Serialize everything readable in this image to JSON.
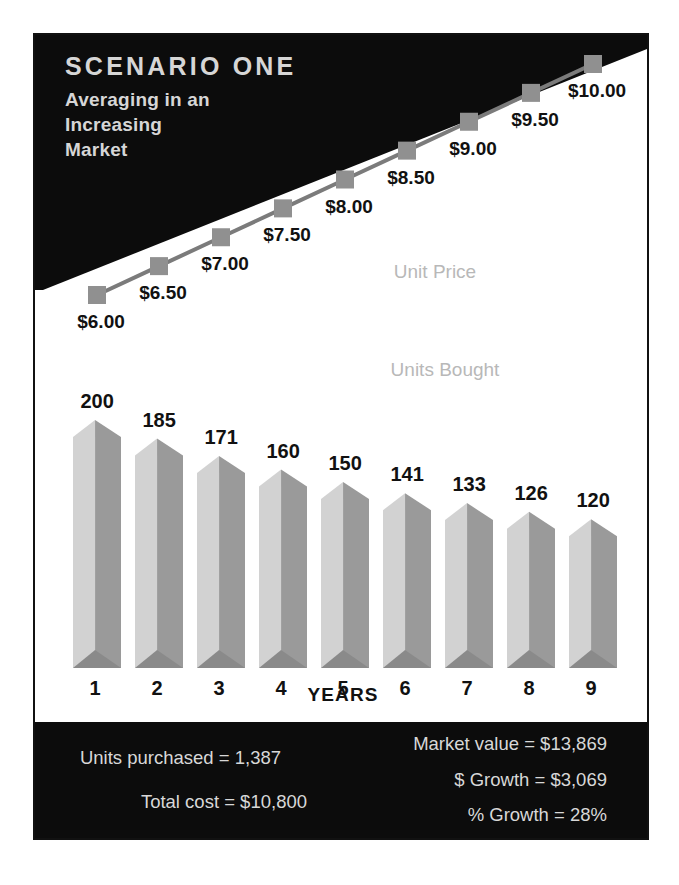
{
  "header": {
    "title": "SCENARIO ONE",
    "subtitle_lines": [
      "Averaging in an",
      "Increasing",
      "Market"
    ]
  },
  "captions": {
    "unit_price": "Unit Price",
    "units_bought": "Units Bought"
  },
  "axis": {
    "x_title": "YEARS"
  },
  "footer": {
    "left": [
      "Units purchased = 1,387",
      "Total cost = $10,800"
    ],
    "right": [
      "Market value = $13,869",
      "$ Growth = $3,069",
      "% Growth = 28%"
    ]
  },
  "colors": {
    "banner": "#0c0c0c",
    "bar_light": "#d2d2d2",
    "bar_dark": "#9a9a9a",
    "bar_foot": "#8a8a8a",
    "marker": "#909090",
    "line": "#7b7b7b",
    "caption": "#b8b8b8",
    "text": "#111111",
    "footer_text": "#d8d8d8"
  },
  "chart_data": {
    "type": "bar",
    "xlabel": "YEARS",
    "ylabel": "",
    "categories": [
      "1",
      "2",
      "3",
      "4",
      "5",
      "6",
      "7",
      "8",
      "9"
    ],
    "grid": false,
    "legend": "inline-captions",
    "series": [
      {
        "name": "Units Bought",
        "type": "bar",
        "values": [
          200,
          185,
          171,
          160,
          150,
          141,
          133,
          126,
          120
        ],
        "labels": [
          "200",
          "185",
          "171",
          "160",
          "150",
          "141",
          "133",
          "126",
          "120"
        ],
        "ylim": [
          0,
          200
        ]
      },
      {
        "name": "Unit Price",
        "type": "line",
        "values": [
          6.0,
          6.5,
          7.0,
          7.5,
          8.0,
          8.5,
          9.0,
          9.5,
          10.0
        ],
        "labels": [
          "$6.00",
          "$6.50",
          "$7.00",
          "$7.50",
          "$8.00",
          "$8.50",
          "$9.00",
          "$9.50",
          "$10.00"
        ],
        "ylim": [
          6.0,
          10.0
        ]
      }
    ],
    "annotations": [
      "Units purchased = 1,387",
      "Total cost = $10,800",
      "Market value = $13,869",
      "$ Growth = $3,069",
      "% Growth = 28%"
    ]
  }
}
